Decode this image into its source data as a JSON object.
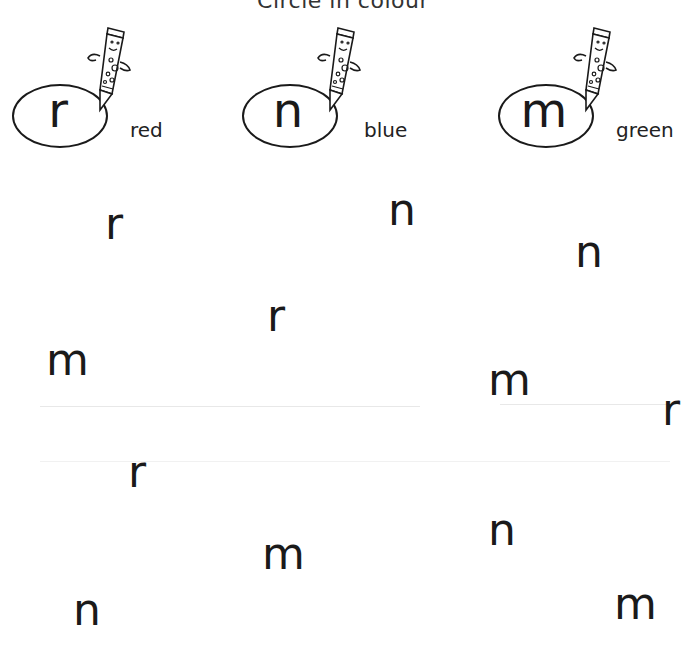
{
  "title": "Circle in colour",
  "key": [
    {
      "letter": "r",
      "color_word": "red",
      "color": "#d32f2f"
    },
    {
      "letter": "n",
      "color_word": "blue",
      "color": "#1e5bd8"
    },
    {
      "letter": "m",
      "color_word": "green",
      "color": "#2e8b3a"
    }
  ],
  "letters": [
    {
      "char": "r",
      "x": 105,
      "y": 210
    },
    {
      "char": "n",
      "x": 388,
      "y": 196
    },
    {
      "char": "n",
      "x": 575,
      "y": 238
    },
    {
      "char": "r",
      "x": 267,
      "y": 302
    },
    {
      "char": "m",
      "x": 46,
      "y": 346
    },
    {
      "char": "m",
      "x": 488,
      "y": 366
    },
    {
      "char": "r",
      "x": 662,
      "y": 396
    },
    {
      "char": "r",
      "x": 128,
      "y": 458
    },
    {
      "char": "n",
      "x": 488,
      "y": 516
    },
    {
      "char": "m",
      "x": 262,
      "y": 540
    },
    {
      "char": "n",
      "x": 73,
      "y": 596
    },
    {
      "char": "m",
      "x": 614,
      "y": 590
    }
  ]
}
